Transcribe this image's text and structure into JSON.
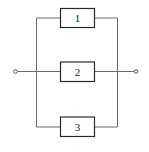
{
  "diagram": {
    "type": "parallel-system-block-diagram",
    "blocks": [
      {
        "id": 1,
        "label": "1"
      },
      {
        "id": 2,
        "label": "2"
      },
      {
        "id": 3,
        "label": "3"
      }
    ],
    "terminals": [
      "input",
      "output"
    ],
    "colors": {
      "wire": "#6b6b6b",
      "box": "#2a2a2a",
      "background": "#ffffff"
    }
  }
}
